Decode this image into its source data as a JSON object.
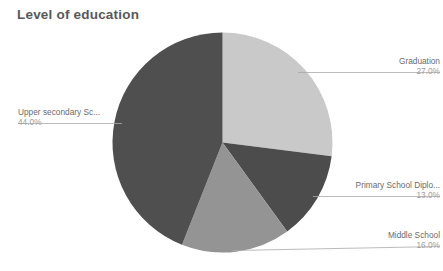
{
  "chart_data": {
    "type": "pie",
    "title": "Level of education",
    "xlabel": "",
    "ylabel": "",
    "legend_position": "callout-labels",
    "grid": false,
    "start_angle_deg": 0,
    "direction": "clockwise",
    "categories": [
      "Graduation",
      "Primary School Diplo...",
      "Middle School",
      "Upper secondary Sc..."
    ],
    "values": [
      27.0,
      13.0,
      16.0,
      44.0
    ],
    "value_labels": [
      "27.0%",
      "13.0%",
      "16.0%",
      "44.0%"
    ],
    "colors": [
      "#c9c9c9",
      "#4c4c4c",
      "#949494",
      "#4f4f4f"
    ],
    "slices": [
      {
        "label": "Graduation",
        "value_label": "27.0%",
        "value": 27.0,
        "color": "#c9c9c9",
        "start_deg": 0,
        "end_deg": 97.2
      },
      {
        "label": "Primary School Diplo...",
        "value_label": "13.0%",
        "value": 13.0,
        "color": "#4c4c4c",
        "start_deg": 97.2,
        "end_deg": 144.0
      },
      {
        "label": "Middle School",
        "value_label": "16.0%",
        "value": 16.0,
        "color": "#949494",
        "start_deg": 144.0,
        "end_deg": 201.6
      },
      {
        "label": "Upper secondary Sc...",
        "value_label": "44.0%",
        "value": 44.0,
        "color": "#4f4f4f",
        "start_deg": 201.6,
        "end_deg": 360.0
      }
    ]
  },
  "title": {
    "text": "Level of education"
  },
  "callouts": {
    "graduation": {
      "name": "Graduation",
      "value": "27.0%"
    },
    "primary_school": {
      "name": "Primary School Diplo...",
      "value": "13.0%"
    },
    "middle_school": {
      "name": "Middle School",
      "value": "16.0%"
    },
    "upper_secondary": {
      "name": "Upper secondary Sc...",
      "value": "44.0%"
    }
  }
}
